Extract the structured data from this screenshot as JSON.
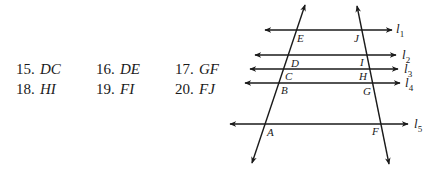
{
  "exercises": [
    {
      "number": "15.",
      "segment": "DC"
    },
    {
      "number": "16.",
      "segment": "DE"
    },
    {
      "number": "17.",
      "segment": "GF"
    },
    {
      "number": "18.",
      "segment": "HI"
    },
    {
      "number": "19.",
      "segment": "FI"
    },
    {
      "number": "20.",
      "segment": "FJ"
    }
  ],
  "figure": {
    "parallel_lines": [
      {
        "label": "l",
        "subscript": "1"
      },
      {
        "label": "l",
        "subscript": "2"
      },
      {
        "label": "l",
        "subscript": "3"
      },
      {
        "label": "l",
        "subscript": "4"
      },
      {
        "label": "l",
        "subscript": "5"
      }
    ],
    "points_left": [
      "E",
      "D",
      "C",
      "B",
      "A"
    ],
    "points_right": [
      "J",
      "I",
      "H",
      "G",
      "F"
    ],
    "line_color": "#1a1a1a"
  }
}
